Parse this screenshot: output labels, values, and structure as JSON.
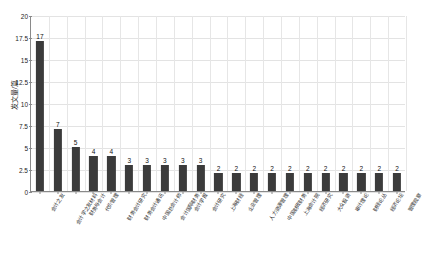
{
  "chart_data": {
    "type": "bar",
    "title": "",
    "xlabel": "",
    "ylabel": "发文量/篇",
    "ylim": [
      0,
      20
    ],
    "yticks": [
      "0",
      "2.5",
      "5",
      "7.5",
      "10",
      "12.5",
      "15",
      "17.5",
      "20"
    ],
    "grid": true,
    "legend": null,
    "bar_color": "#3b3b3b",
    "categories": [
      "会计之友",
      "会计学之友材料",
      "财务与会计",
      "代价管理",
      "财务会计研究",
      "财务会计通讯",
      "中国总会计师",
      "会计国际财务",
      "会计学报",
      "会计研究",
      "上海财经",
      "企业管理",
      "人力资源管理",
      "中国财政财务",
      "上海会计院",
      "经济研究",
      "大众投资",
      "审计理论",
      "财经论丛",
      "经济论坛",
      "管理观察"
    ],
    "values": [
      17,
      7,
      5,
      4,
      4,
      3,
      3,
      3,
      3,
      3,
      2,
      2,
      2,
      2,
      2,
      2,
      2,
      2,
      2,
      2,
      2
    ],
    "value_labels": [
      "17",
      "7",
      "5",
      "4",
      "4",
      "3",
      "3",
      "3",
      "3",
      "3",
      "2",
      "2",
      "2",
      "2",
      "2",
      "2",
      "2",
      "2",
      "2",
      "2",
      "2"
    ]
  }
}
